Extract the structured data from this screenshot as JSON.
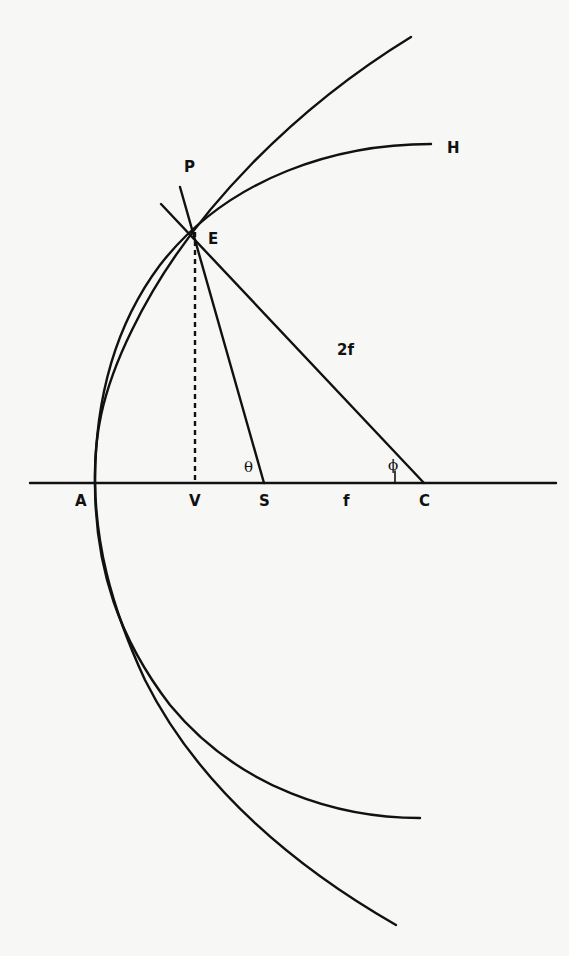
{
  "diagram": {
    "colors": {
      "ink": "#111111",
      "background": "#f7f7f5"
    },
    "labels": {
      "P": "P",
      "E": "E",
      "H": "H",
      "A": "A",
      "V": "V",
      "S": "S",
      "C": "C",
      "f": "f",
      "two_f": "2f",
      "theta": "θ",
      "phi": "ϕ"
    },
    "points": {
      "A": [
        95,
        483
      ],
      "V": [
        195,
        483
      ],
      "S": [
        264,
        483
      ],
      "C": [
        424,
        483
      ],
      "E": [
        195,
        228
      ]
    },
    "elements": [
      {
        "name": "axis-line",
        "from": [
          30,
          483
        ],
        "to": [
          556,
          483
        ]
      },
      {
        "name": "parabola",
        "vertex": "A",
        "focus": "S"
      },
      {
        "name": "circle-arc",
        "center": "C",
        "passes_through": "A"
      },
      {
        "name": "line-SE-extended-to-P",
        "from": [
          180,
          187
        ],
        "to": [
          264,
          483
        ]
      },
      {
        "name": "line-CE-2f",
        "from": [
          161,
          204
        ],
        "to": [
          424,
          483
        ]
      },
      {
        "name": "dashed-EV",
        "from": [
          195,
          228
        ],
        "to": [
          195,
          483
        ]
      }
    ]
  }
}
